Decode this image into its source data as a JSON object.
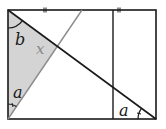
{
  "diagram": {
    "type": "geometry",
    "rectangle": {
      "x1": 8,
      "y1": 10,
      "x2": 156,
      "y2": 119
    },
    "inner_vertical_line_x": 113,
    "shaded_triangle": {
      "points": [
        [
          8,
          10
        ],
        [
          8,
          119
        ],
        [
          57.5,
          46
        ]
      ],
      "fill": "#d4d4d4"
    },
    "diagonal": {
      "from": [
        8,
        10
      ],
      "to": [
        156,
        119
      ],
      "color": "#1a1a1a"
    },
    "gray_line": {
      "from": [
        8,
        119
      ],
      "to": [
        82,
        10
      ],
      "color": "#8c8c8c"
    },
    "tick_marks": [
      {
        "x": 45,
        "y": 10
      },
      {
        "x": 119,
        "y": 10
      }
    ],
    "labels": {
      "b": "b",
      "x": "x",
      "a_left": "a",
      "a_right": "a"
    },
    "colors": {
      "stroke": "#1a1a1a",
      "gray_line": "#8c8c8c",
      "shade": "#d4d4d4",
      "label_x": "#8a8a8a"
    }
  }
}
